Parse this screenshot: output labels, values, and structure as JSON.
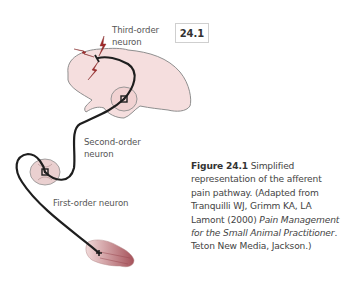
{
  "figure": {
    "badge": "24.1",
    "labels": {
      "third_order_line1": "Third-order",
      "third_order_line2": "neuron",
      "second_order_line1": "Second-order",
      "second_order_line2": "neuron",
      "first_order": "First-order neuron"
    },
    "caption": {
      "figure_number": "Figure 24.1",
      "text_part1": " Simplified representation of the afferent pain pathway. (Adapted from Tranquilli WJ, Grimm KA, LA Lamont (2000) ",
      "book_title": "Pain Management for the Small Animal Practitioner",
      "text_part2": ". Teton New Media, Jackson.)"
    },
    "colors": {
      "brain_fill": "#f5dcdc",
      "brain_stroke": "#8a8a8a",
      "pathway": "#1f1f1f",
      "lightning": "#a32b2b",
      "hand_fill": "#b5686e"
    }
  }
}
